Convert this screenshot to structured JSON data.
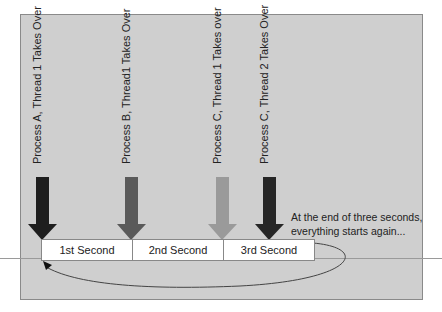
{
  "diagram": {
    "title": "",
    "events": [
      {
        "label": "Process A, Thread 1 Takes Over",
        "arrow_color": "#1e1e1e",
        "x": 42
      },
      {
        "label": "Process B, Thread1 Takes Over",
        "arrow_color": "#5a5a5a",
        "x": 131
      },
      {
        "label": "Process C, Thread 1 Takes over",
        "arrow_color": "#9a9a9a",
        "x": 222
      },
      {
        "label": "Process C, Thread 2 Takes Over",
        "arrow_color": "#262626",
        "x": 269
      }
    ],
    "timeline": {
      "segments": [
        {
          "label": "1st Second"
        },
        {
          "label": "2nd Second"
        },
        {
          "label": "3rd Second"
        }
      ]
    },
    "note": {
      "line1": "At the end of three seconds,",
      "line2": "everything starts again..."
    },
    "colors": {
      "panel": "#cfcfcf",
      "panel_border": "#8a8a8a",
      "loop_line": "#444444"
    }
  }
}
